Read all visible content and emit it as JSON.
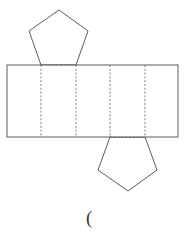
{
  "figure": {
    "background_color": "#ffffff",
    "solid_stroke_color": "#4a4a4a",
    "dashed_stroke_color": "#6e6e6e",
    "fill_color": "#ffffff",
    "stroke_width": 0.9,
    "dash_pattern": "2,1.8",
    "canvas": {
      "width": 189,
      "height": 241
    }
  },
  "geometry": {
    "rectangle": {
      "name": "lateral-faces-strip",
      "x": 7,
      "y": 65,
      "width": 171,
      "height": 72,
      "panel_count": 5,
      "fold_line_x": [
        41,
        76,
        110,
        145
      ]
    },
    "top_pentagon": {
      "name": "top-pentagon-face",
      "points": "29,31 59,10 88,31 76,65 41,65",
      "base_left_x": 41,
      "base_right_x": 76,
      "base_y": 65,
      "apex_x": 59,
      "apex_y": 10
    },
    "bottom_pentagon": {
      "name": "bottom-pentagon-face",
      "points": "110,137 145,137 157,170 128,191 98,170",
      "base_left_x": 110,
      "base_right_x": 145,
      "base_y": 137,
      "apex_x": 128,
      "apex_y": 191
    },
    "fold_edges": {
      "top_pentagon_base": {
        "x1": 41,
        "y1": 65,
        "x2": 76,
        "y2": 65
      },
      "bottom_pentagon_base": {
        "x1": 110,
        "y1": 137,
        "x2": 145,
        "y2": 137
      }
    }
  },
  "annotations": {
    "caption": {
      "text": "(",
      "x": 86,
      "y": 208
    }
  }
}
